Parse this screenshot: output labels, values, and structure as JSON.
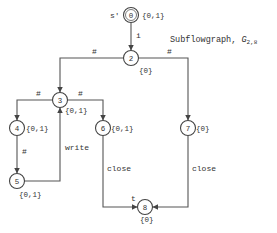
{
  "title": {
    "text": "Subflowgraph, ",
    "symbol": "G",
    "subscript": "2,8"
  },
  "start_label": "s'",
  "nodes": [
    {
      "id": "0",
      "set": "{0,1}"
    },
    {
      "id": "2",
      "set": "{0}"
    },
    {
      "id": "3",
      "set": "{0,1}"
    },
    {
      "id": "4",
      "set": "{0,1}"
    },
    {
      "id": "5",
      "set": "{0,1}"
    },
    {
      "id": "6",
      "set": "{0,1}"
    },
    {
      "id": "7",
      "set": "{0}"
    },
    {
      "id": "8",
      "set": "{0}"
    }
  ],
  "edges": [
    {
      "from": "0",
      "to": "2",
      "label": "i"
    },
    {
      "from": "2",
      "to": "3",
      "label": "#"
    },
    {
      "from": "2",
      "to": "7",
      "label": "#"
    },
    {
      "from": "3",
      "to": "4",
      "label": "#"
    },
    {
      "from": "3",
      "to": "6",
      "label": "#"
    },
    {
      "from": "4",
      "to": "5",
      "label": "#"
    },
    {
      "from": "5",
      "to": "3",
      "label": "write"
    },
    {
      "from": "6",
      "to": "8",
      "label": "close"
    },
    {
      "from": "7",
      "to": "8",
      "label": "close"
    }
  ],
  "end_label": "t"
}
